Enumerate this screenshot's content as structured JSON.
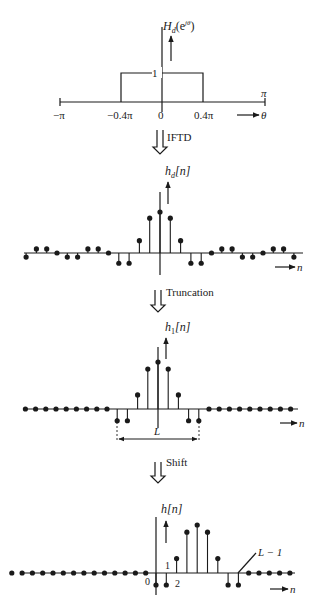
{
  "panel1": {
    "ylabel": "H",
    "ylabel_sub": "d",
    "ylabel_arg": "(e",
    "ylabel_sup": "jθ",
    "ylabel_close": ")",
    "height_label": "1",
    "ticks": [
      "−π",
      "−0.4π",
      "0",
      "0.4π"
    ],
    "pi_label": "π",
    "xlabel": "θ"
  },
  "step1": {
    "label": "IFTD"
  },
  "panel2": {
    "ylabel": "h",
    "ylabel_sub": "d",
    "ylabel_arg": "[n]",
    "xlabel": "n"
  },
  "step2": {
    "label": "Truncation"
  },
  "panel3": {
    "ylabel": "h",
    "ylabel_sub": "1",
    "ylabel_arg": "[n]",
    "xlabel": "n",
    "width_label": "L"
  },
  "step3": {
    "label": "Shift"
  },
  "panel4": {
    "ylabel": "h[n]",
    "xlabel": "n",
    "tick0": "0",
    "tick1": "1",
    "tick2": "2",
    "end_label": "L − 1"
  },
  "chart_data": [
    {
      "type": "line",
      "title": "Ideal lowpass frequency response H_d(e^jθ)",
      "xlabel": "θ",
      "ylabel": "H_d(e^jθ)",
      "x": [
        -3.1416,
        -1.2566,
        -1.2566,
        1.2566,
        1.2566,
        3.1416
      ],
      "values": [
        0,
        0,
        1,
        1,
        0,
        0
      ],
      "x_ticks": [
        "−π",
        "−0.4π",
        "0",
        "0.4π",
        "π"
      ],
      "cutoff": "0.4π"
    },
    {
      "type": "scatter",
      "title": "Ideal impulse response h_d[n] (infinite, sinc-shaped)",
      "xlabel": "n",
      "ylabel": "h_d[n]",
      "x": [
        -13,
        -12,
        -11,
        -10,
        -9,
        -8,
        -7,
        -6,
        -5,
        -4,
        -3,
        -2,
        -1,
        0,
        1,
        2,
        3,
        4,
        5,
        6,
        7,
        8,
        9,
        10,
        11,
        12,
        13
      ],
      "values": [
        -0.1,
        0.1,
        0.1,
        0,
        -0.1,
        -0.1,
        0.1,
        0.1,
        0,
        -0.25,
        -0.25,
        0.3,
        0.85,
        1.0,
        0.85,
        0.3,
        -0.25,
        -0.25,
        0,
        0.1,
        0.1,
        -0.1,
        -0.1,
        0,
        0.1,
        0.1,
        -0.1
      ]
    },
    {
      "type": "scatter",
      "title": "Truncated impulse response h_1[n]",
      "xlabel": "n",
      "ylabel": "h_1[n]",
      "x": [
        -13,
        -12,
        -11,
        -10,
        -9,
        -8,
        -7,
        -6,
        -5,
        -4,
        -3,
        -2,
        -1,
        0,
        1,
        2,
        3,
        4,
        5,
        6,
        7,
        8,
        9,
        10,
        11,
        12,
        13
      ],
      "values": [
        0,
        0,
        0,
        0,
        0,
        0,
        0,
        0,
        0,
        -0.25,
        -0.25,
        0.3,
        0.85,
        1.0,
        0.85,
        0.3,
        -0.25,
        -0.25,
        0,
        0,
        0,
        0,
        0,
        0,
        0,
        0,
        0
      ],
      "window_length": "L"
    },
    {
      "type": "scatter",
      "title": "Shifted causal impulse response h[n]",
      "xlabel": "n",
      "ylabel": "h[n]",
      "x": [
        -14,
        -13,
        -12,
        -11,
        -10,
        -9,
        -8,
        -7,
        -6,
        -5,
        -4,
        -3,
        -2,
        -1,
        0,
        1,
        2,
        3,
        4,
        5,
        6,
        7,
        8,
        9,
        10,
        11,
        12,
        13
      ],
      "values": [
        0,
        0,
        0,
        0,
        0,
        0,
        0,
        0,
        0,
        0,
        0,
        0,
        0,
        0,
        -0.25,
        -0.25,
        0.3,
        0.85,
        1.0,
        0.85,
        0.3,
        -0.25,
        -0.25,
        0,
        0,
        0,
        0,
        0
      ],
      "annotations": [
        "0",
        "1",
        "2",
        "L − 1"
      ]
    }
  ]
}
